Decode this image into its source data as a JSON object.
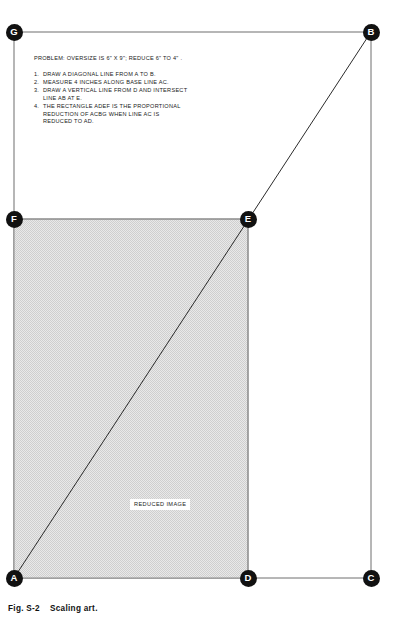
{
  "figure": {
    "caption_number": "Fig. S-2",
    "caption_title": "Scaling art."
  },
  "instructions": {
    "problem": "PROBLEM: OVERSIZE IS 6\" X 9\"; REDUCE 6\" TO 4\" .",
    "steps": [
      {
        "number": "1.",
        "lines": [
          "DRAW A DIAGONAL LINE FROM A TO B."
        ]
      },
      {
        "number": "2.",
        "lines": [
          "MEASURE 4 INCHES ALONG BASE LINE AC."
        ]
      },
      {
        "number": "3.",
        "lines": [
          "DRAW A VERTICAL LINE FROM D AND INTERSECT",
          "LINE AB AT E."
        ]
      },
      {
        "number": "4.",
        "lines": [
          "THE RECTANGLE ADEF IS THE PROPORTIONAL",
          "REDUCTION OF ACBG WHEN LINE AC IS",
          "REDUCED TO AD."
        ]
      }
    ]
  },
  "labels": {
    "reduced_image": "REDUCED IMAGE"
  },
  "vertices": [
    {
      "id": "G",
      "label": "G",
      "x": 14,
      "y": 32
    },
    {
      "id": "B",
      "label": "B",
      "x": 371,
      "y": 32
    },
    {
      "id": "F",
      "label": "F",
      "x": 14,
      "y": 219
    },
    {
      "id": "E",
      "label": "E",
      "x": 248,
      "y": 219
    },
    {
      "id": "A",
      "label": "A",
      "x": 14,
      "y": 578
    },
    {
      "id": "D",
      "label": "D",
      "x": 248,
      "y": 578
    },
    {
      "id": "C",
      "label": "C",
      "x": 371,
      "y": 578
    }
  ],
  "geometry": {
    "oversize_rect": {
      "x": 14,
      "y": 32,
      "width": 357,
      "height": 546
    },
    "reduced_rect": {
      "x": 14,
      "y": 219,
      "width": 234,
      "height": 359
    },
    "diagonal": {
      "x1": 14,
      "y1": 578,
      "x2": 371,
      "y2": 32
    }
  },
  "colors": {
    "outline": "#6e6e6e",
    "diagonal": "#2b2b2b",
    "reduced_fill": "#d6d6d6",
    "reduced_outline": "#8a8a8a",
    "marker_bg": "#111111",
    "marker_fg": "#ffffff",
    "text": "#1a1a1a",
    "page_bg": "#ffffff"
  }
}
